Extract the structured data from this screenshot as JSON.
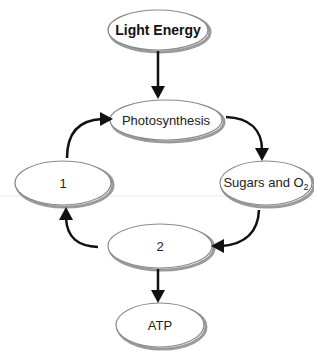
{
  "diagram": {
    "nodes": {
      "light_energy": {
        "label": "Light Energy",
        "cx": 158,
        "cy": 30,
        "rx": 50,
        "ry": 20,
        "bold": true
      },
      "photosynthesis": {
        "label": "Photosynthesis",
        "cx": 166,
        "cy": 120,
        "rx": 56,
        "ry": 20
      },
      "sugars_o2": {
        "label": "Sugars and O",
        "subscript": "2",
        "cx": 266,
        "cy": 183,
        "rx": 46,
        "ry": 22
      },
      "blank_1": {
        "label": "1",
        "cx": 63,
        "cy": 183,
        "rx": 48,
        "ry": 22
      },
      "blank_2": {
        "label": "2",
        "cx": 160,
        "cy": 246,
        "rx": 52,
        "ry": 22
      },
      "atp": {
        "label": "ATP",
        "cx": 160,
        "cy": 325,
        "rx": 44,
        "ry": 22
      }
    },
    "edges": [
      {
        "from": "Light Energy",
        "to": "Photosynthesis",
        "style": "straight"
      },
      {
        "from": "Photosynthesis",
        "to": "Sugars and O2",
        "style": "curved"
      },
      {
        "from": "Sugars and O2",
        "to": "2",
        "style": "curved"
      },
      {
        "from": "2",
        "to": "1",
        "style": "curved"
      },
      {
        "from": "1",
        "to": "Photosynthesis",
        "style": "curved"
      },
      {
        "from": "2",
        "to": "ATP",
        "style": "straight"
      }
    ],
    "colors": {
      "ellipse_stroke": "#8a8a8a",
      "ellipse_shadow": "#9a9a9a",
      "arrow": "#111111",
      "text": "#222222"
    }
  }
}
